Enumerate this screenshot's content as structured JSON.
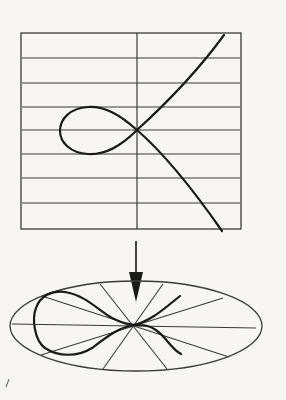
{
  "figure": {
    "colors": {
      "background": "#f7f6f3",
      "ink": "#1a1a1a",
      "grid": "#3a3a3a"
    },
    "top_panel": {
      "box": {
        "x": 21,
        "y": 33,
        "w": 220,
        "h": 196
      },
      "vertical_axis_x": 137,
      "horizontal_lines_y": [
        58,
        83,
        107,
        130,
        154,
        178,
        203
      ],
      "node": {
        "x": 137,
        "y": 130
      }
    },
    "arrow": {
      "x": 136,
      "y1": 241,
      "y2": 302,
      "head_top": 272
    },
    "bottom_panel": {
      "ellipse": {
        "cx": 136,
        "cy": 326,
        "rx": 126,
        "ry": 45
      },
      "center": {
        "x": 133,
        "y": 325
      },
      "radial_line_count": 6
    },
    "labels": []
  }
}
